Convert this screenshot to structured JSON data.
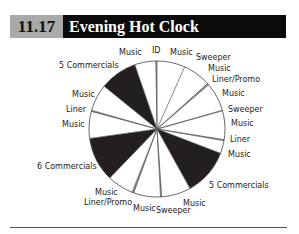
{
  "header": {
    "number": "11.17",
    "title": "Evening Hot Clock"
  },
  "chart_data": {
    "type": "pie",
    "title": "Evening Hot Clock",
    "figure_number": "11.17",
    "start_angle_deg": 0,
    "direction": "clockwise",
    "slices": [
      {
        "label": "Music",
        "start": 0,
        "end": 24,
        "fill": "#ffffff"
      },
      {
        "label": "Music",
        "start": 24,
        "end": 48,
        "fill": "#ffffff"
      },
      {
        "label": "Liner/Promo",
        "start": 48,
        "end": 49.5,
        "fill": "#888888"
      },
      {
        "label": "Music",
        "start": 49.5,
        "end": 74,
        "fill": "#ffffff"
      },
      {
        "label": "Sweeper",
        "start": 74,
        "end": 74.5,
        "fill": "#ffffff"
      },
      {
        "label": "Music",
        "start": 74.5,
        "end": 99,
        "fill": "#ffffff"
      },
      {
        "label": "Liner",
        "start": 99,
        "end": 100,
        "fill": "#888888"
      },
      {
        "label": "Music",
        "start": 100,
        "end": 111,
        "fill": "#ffffff"
      },
      {
        "label": "5 Commercials",
        "start": 111,
        "end": 151,
        "fill": "#231f20"
      },
      {
        "label": "Music",
        "start": 151,
        "end": 176,
        "fill": "#ffffff"
      },
      {
        "label": "Sweeper",
        "start": 176,
        "end": 177,
        "fill": "#888888"
      },
      {
        "label": "Music",
        "start": 177,
        "end": 200,
        "fill": "#ffffff"
      },
      {
        "label": "Liner/Promo",
        "start": 200,
        "end": 201.5,
        "fill": "#888888"
      },
      {
        "label": "Music",
        "start": 201.5,
        "end": 224,
        "fill": "#ffffff"
      },
      {
        "label": "6 Commercials",
        "start": 224,
        "end": 262,
        "fill": "#231f20"
      },
      {
        "label": "Music",
        "start": 262,
        "end": 285,
        "fill": "#ffffff"
      },
      {
        "label": "Liner",
        "start": 285,
        "end": 286,
        "fill": "#888888"
      },
      {
        "label": "Music",
        "start": 286,
        "end": 309,
        "fill": "#ffffff"
      },
      {
        "label": "5 Commercials",
        "start": 309,
        "end": 341,
        "fill": "#231f20"
      },
      {
        "label": "Music",
        "start": 341,
        "end": 359,
        "fill": "#ffffff"
      },
      {
        "label": "ID",
        "start": 359,
        "end": 360,
        "fill": "#888888"
      }
    ],
    "labels": [
      {
        "text": "Music",
        "x": 119,
        "y": 55
      },
      {
        "text": "ID",
        "x": 152,
        "y": 53
      },
      {
        "text": "Music",
        "x": 170,
        "y": 55
      },
      {
        "text": "Sweeper",
        "x": 196,
        "y": 60
      },
      {
        "text": "Music",
        "x": 208,
        "y": 71
      },
      {
        "text": "Liner/Promo",
        "x": 212,
        "y": 82
      },
      {
        "text": "Music",
        "x": 222,
        "y": 96
      },
      {
        "text": "Sweeper",
        "x": 228,
        "y": 112
      },
      {
        "text": "Music",
        "x": 231,
        "y": 126
      },
      {
        "text": "Liner",
        "x": 230,
        "y": 142
      },
      {
        "text": "Music",
        "x": 228,
        "y": 157
      },
      {
        "text": "5 Commercials",
        "x": 209,
        "y": 188
      },
      {
        "text": "Music",
        "x": 183,
        "y": 206
      },
      {
        "text": "Sweeper",
        "x": 156,
        "y": 213
      },
      {
        "text": "Music",
        "x": 133,
        "y": 211
      },
      {
        "text": "Liner/Promo",
        "x": 84,
        "y": 205
      },
      {
        "text": "Music",
        "x": 95,
        "y": 195
      },
      {
        "text": "6 Commercials",
        "x": 37,
        "y": 169
      },
      {
        "text": "Music",
        "x": 62,
        "y": 127
      },
      {
        "text": "Liner",
        "x": 66,
        "y": 112
      },
      {
        "text": "Music",
        "x": 72,
        "y": 97
      },
      {
        "text": "5 Commercials",
        "x": 59,
        "y": 68
      }
    ],
    "center": [
      157,
      129
    ],
    "radius": 68
  }
}
